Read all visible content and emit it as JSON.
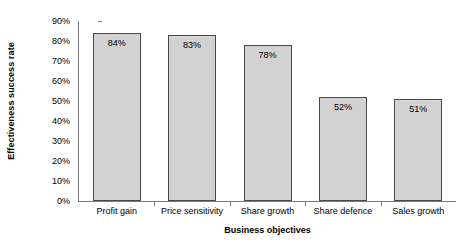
{
  "chart_data": {
    "type": "bar",
    "title": "",
    "categories": [
      "Profit gain",
      "Price sensitivity",
      "Share growth",
      "Share defence",
      "Sales growth"
    ],
    "values": [
      84,
      83,
      78,
      52,
      51
    ],
    "value_labels": [
      "84%",
      "83%",
      "78%",
      "52%",
      "51%"
    ],
    "xlabel": "Business objectives",
    "ylabel": "Effectiveness success rate",
    "ylim": [
      0,
      90
    ],
    "ytick_values": [
      0,
      10,
      20,
      30,
      40,
      50,
      60,
      70,
      80,
      90
    ],
    "ytick_labels": [
      "0%",
      "10%",
      "20%",
      "30%",
      "40%",
      "50%",
      "60%",
      "70%",
      "80%",
      "90%"
    ],
    "grid": false,
    "legend": "none",
    "bar_fill_color": "#d2d2d2",
    "bar_border_color": "#4a4a4a",
    "axis_color": "#7a7a7a",
    "text_color": "#000000",
    "background_color": "#ffffff"
  }
}
